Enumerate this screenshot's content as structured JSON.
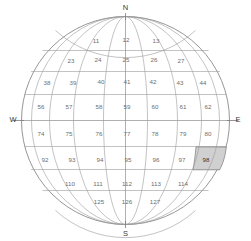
{
  "figure": {
    "projection": "orthographic",
    "highlight_color": "#d0d0d0",
    "grid_color": "#9a9a9a",
    "limb_color": "#8a8a8a",
    "label_color": "#6e6e6e"
  },
  "cardinals": {
    "north": "N",
    "south": "S",
    "east": "E",
    "west": "W"
  },
  "chart_data": {
    "type": "map",
    "xlabel": "",
    "ylabel": "",
    "center": {
      "cx": 125.5,
      "cy": 120.5,
      "r": 104
    },
    "highlighted_cell": "98",
    "rows": [
      {
        "index": 1,
        "lat_band": "75N-60N",
        "cells": [
          {
            "id": "11",
            "x": 96,
            "y": 41
          },
          {
            "id": "12",
            "x": 126,
            "y": 40
          },
          {
            "id": "13",
            "x": 156,
            "y": 41
          }
        ]
      },
      {
        "index": 2,
        "lat_band": "60N-45N",
        "cells": [
          {
            "id": "23",
            "x": 71,
            "y": 61
          },
          {
            "id": "24",
            "x": 98,
            "y": 60
          },
          {
            "id": "25",
            "x": 126,
            "y": 60
          },
          {
            "id": "26",
            "x": 154,
            "y": 60
          },
          {
            "id": "27",
            "x": 181,
            "y": 61
          }
        ]
      },
      {
        "index": 3,
        "lat_band": "45N-30N",
        "cells": [
          {
            "id": "38",
            "x": 47,
            "y": 83
          },
          {
            "id": "39",
            "x": 73,
            "y": 83
          },
          {
            "id": "40",
            "x": 101,
            "y": 82
          },
          {
            "id": "41",
            "x": 127,
            "y": 82
          },
          {
            "id": "42",
            "x": 153,
            "y": 82
          },
          {
            "id": "43",
            "x": 180,
            "y": 83
          },
          {
            "id": "44",
            "x": 203,
            "y": 83
          }
        ]
      },
      {
        "index": 4,
        "lat_band": "30N-15N",
        "cells": [
          {
            "id": "56",
            "x": 41,
            "y": 107
          },
          {
            "id": "57",
            "x": 69,
            "y": 107
          },
          {
            "id": "58",
            "x": 99,
            "y": 107
          },
          {
            "id": "59",
            "x": 127,
            "y": 107
          },
          {
            "id": "60",
            "x": 155,
            "y": 107
          },
          {
            "id": "61",
            "x": 183,
            "y": 107
          },
          {
            "id": "62",
            "x": 208,
            "y": 107
          }
        ]
      },
      {
        "index": 5,
        "lat_band": "15N-0",
        "cells": [
          {
            "id": "74",
            "x": 41,
            "y": 134
          },
          {
            "id": "75",
            "x": 69,
            "y": 134
          },
          {
            "id": "76",
            "x": 99,
            "y": 134
          },
          {
            "id": "77",
            "x": 127,
            "y": 134
          },
          {
            "id": "78",
            "x": 155,
            "y": 134
          },
          {
            "id": "79",
            "x": 183,
            "y": 134
          },
          {
            "id": "80",
            "x": 208,
            "y": 134
          }
        ]
      },
      {
        "index": 6,
        "lat_band": "0-15S",
        "cells": [
          {
            "id": "92",
            "x": 45,
            "y": 160
          },
          {
            "id": "93",
            "x": 72,
            "y": 160
          },
          {
            "id": "94",
            "x": 100,
            "y": 160
          },
          {
            "id": "95",
            "x": 128,
            "y": 160
          },
          {
            "id": "96",
            "x": 156,
            "y": 160
          },
          {
            "id": "97",
            "x": 182,
            "y": 160
          },
          {
            "id": "98",
            "x": 206,
            "y": 160
          }
        ]
      },
      {
        "index": 7,
        "lat_band": "15S-30S",
        "cells": [
          {
            "id": "110",
            "x": 70,
            "y": 184
          },
          {
            "id": "111",
            "x": 98,
            "y": 184
          },
          {
            "id": "112",
            "x": 127,
            "y": 184
          },
          {
            "id": "113",
            "x": 156,
            "y": 184
          },
          {
            "id": "114",
            "x": 183,
            "y": 184
          }
        ]
      },
      {
        "index": 8,
        "lat_band": "30S-45S",
        "cells": [
          {
            "id": "125",
            "x": 99,
            "y": 202
          },
          {
            "id": "126",
            "x": 127,
            "y": 202
          },
          {
            "id": "127",
            "x": 155,
            "y": 202
          }
        ]
      }
    ]
  }
}
